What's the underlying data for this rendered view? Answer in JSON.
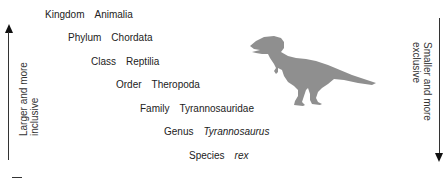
{
  "diagram": {
    "ranks": [
      {
        "level": "Kingdom",
        "value": "Animalia",
        "italic": false
      },
      {
        "level": "Phylum",
        "value": "Chordata",
        "italic": false
      },
      {
        "level": "Class",
        "value": "Reptilia",
        "italic": false
      },
      {
        "level": "Order",
        "value": "Theropoda",
        "italic": false
      },
      {
        "level": "Family",
        "value": "Tyrannosauridae",
        "italic": false
      },
      {
        "level": "Genus",
        "value": "Tyrannosaurus",
        "italic": true
      },
      {
        "level": "Species",
        "value": "rex",
        "italic": false
      }
    ],
    "left_axis": {
      "line1": "Larger and more",
      "line2": "inclusive",
      "direction": "up"
    },
    "right_axis": {
      "line1": "Smaller and more",
      "line2": "exclusive",
      "direction": "down"
    },
    "illustration": "tyrannosaurus-silhouette",
    "colors": {
      "silhouette": "#8f8f8f",
      "text": "#222222",
      "arrow": "#111111"
    }
  }
}
